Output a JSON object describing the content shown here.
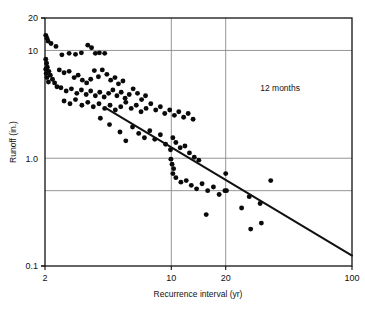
{
  "chart_data": {
    "type": "scatter",
    "title": "",
    "xlabel": "Recurrence interval (yr)",
    "ylabel": "Runoff (in.)",
    "xscale": "log",
    "yscale": "log",
    "xlim": [
      2,
      100
    ],
    "ylim": [
      0.1,
      20
    ],
    "xticks": [
      2,
      10,
      20,
      100
    ],
    "xtick_labels": [
      "2",
      "10",
      "20",
      "100"
    ],
    "yticks": [
      0.1,
      1.0,
      10,
      20
    ],
    "ytick_labels": [
      "0.1",
      "1.0",
      "10",
      "20"
    ],
    "gridlines_x": [
      10,
      20
    ],
    "gridlines_y": [
      0.5,
      1.0,
      10
    ],
    "grid": true,
    "legend": "none",
    "annotations": [
      {
        "text": "12 months",
        "x": 40,
        "y": 4.2
      }
    ],
    "series": [
      {
        "name": "trend-line",
        "type": "line",
        "points": [
          [
            4.3,
            2.95
          ],
          [
            100,
            0.125
          ]
        ]
      },
      {
        "name": "observations",
        "type": "scatter",
        "points": [
          [
            2.02,
            13.8
          ],
          [
            2.05,
            13.0
          ],
          [
            2.08,
            12.2
          ],
          [
            2.16,
            11.6
          ],
          [
            2.3,
            10.9
          ],
          [
            2.48,
            9.1
          ],
          [
            2.72,
            9.4
          ],
          [
            2.95,
            9.2
          ],
          [
            3.18,
            9.5
          ],
          [
            3.45,
            11.2
          ],
          [
            3.62,
            10.6
          ],
          [
            3.8,
            9.4
          ],
          [
            4.0,
            9.5
          ],
          [
            4.28,
            9.4
          ],
          [
            2.02,
            8.3
          ],
          [
            2.04,
            7.6
          ],
          [
            2.06,
            7.0
          ],
          [
            2.1,
            6.4
          ],
          [
            2.14,
            5.9
          ],
          [
            2.2,
            5.4
          ],
          [
            2.26,
            5.0
          ],
          [
            2.33,
            4.6
          ],
          [
            2.02,
            6.7
          ],
          [
            2.03,
            6.1
          ],
          [
            2.05,
            5.6
          ],
          [
            2.09,
            5.1
          ],
          [
            2.4,
            6.6
          ],
          [
            2.55,
            6.2
          ],
          [
            2.72,
            6.4
          ],
          [
            2.9,
            5.6
          ],
          [
            3.05,
            5.9
          ],
          [
            3.22,
            5.3
          ],
          [
            3.4,
            5.0
          ],
          [
            3.58,
            5.4
          ],
          [
            3.75,
            6.5
          ],
          [
            3.95,
            5.7
          ],
          [
            4.15,
            6.6
          ],
          [
            4.4,
            6.0
          ],
          [
            4.62,
            5.3
          ],
          [
            4.88,
            5.6
          ],
          [
            5.1,
            4.9
          ],
          [
            5.4,
            5.2
          ],
          [
            2.45,
            4.5
          ],
          [
            2.62,
            4.2
          ],
          [
            2.8,
            4.4
          ],
          [
            3.0,
            4.0
          ],
          [
            3.18,
            4.3
          ],
          [
            3.38,
            3.9
          ],
          [
            3.58,
            4.2
          ],
          [
            3.8,
            3.8
          ],
          [
            4.02,
            4.1
          ],
          [
            4.25,
            3.7
          ],
          [
            4.5,
            4.0
          ],
          [
            4.75,
            4.3
          ],
          [
            5.0,
            3.8
          ],
          [
            5.28,
            4.1
          ],
          [
            5.55,
            3.6
          ],
          [
            5.85,
            3.9
          ],
          [
            6.15,
            4.4
          ],
          [
            6.5,
            4.0
          ],
          [
            6.85,
            3.5
          ],
          [
            7.2,
            3.8
          ],
          [
            2.55,
            3.4
          ],
          [
            2.75,
            3.2
          ],
          [
            2.95,
            3.5
          ],
          [
            3.2,
            3.1
          ],
          [
            3.45,
            3.3
          ],
          [
            3.7,
            3.0
          ],
          [
            3.98,
            3.2
          ],
          [
            4.28,
            2.9
          ],
          [
            4.58,
            3.1
          ],
          [
            4.9,
            2.8
          ],
          [
            5.25,
            3.0
          ],
          [
            5.6,
            3.3
          ],
          [
            6.0,
            2.9
          ],
          [
            6.4,
            3.1
          ],
          [
            6.8,
            2.7
          ],
          [
            7.25,
            2.9
          ],
          [
            7.7,
            3.2
          ],
          [
            8.2,
            2.8
          ],
          [
            8.7,
            3.0
          ],
          [
            9.2,
            2.6
          ],
          [
            9.8,
            2.8
          ],
          [
            10.4,
            2.5
          ],
          [
            11.0,
            2.7
          ],
          [
            11.7,
            2.4
          ],
          [
            12.4,
            2.6
          ],
          [
            13.2,
            2.3
          ],
          [
            4.05,
            2.35
          ],
          [
            4.55,
            2.05
          ],
          [
            5.2,
            1.75
          ],
          [
            5.6,
            1.45
          ],
          [
            6.1,
            1.95
          ],
          [
            6.6,
            1.7
          ],
          [
            7.1,
            1.55
          ],
          [
            7.6,
            1.8
          ],
          [
            8.1,
            1.5
          ],
          [
            8.7,
            1.65
          ],
          [
            9.3,
            1.35
          ],
          [
            9.9,
            1.2
          ],
          [
            10.2,
            1.55
          ],
          [
            10.6,
            1.4
          ],
          [
            11.2,
            1.25
          ],
          [
            11.9,
            1.3
          ],
          [
            12.6,
            1.12
          ],
          [
            13.4,
            1.02
          ],
          [
            14.2,
            0.96
          ],
          [
            9.95,
            0.98
          ],
          [
            10.1,
            0.88
          ],
          [
            10.3,
            0.8
          ],
          [
            10.2,
            0.72
          ],
          [
            10.6,
            0.66
          ],
          [
            11.3,
            0.6
          ],
          [
            12.1,
            0.62
          ],
          [
            12.9,
            0.56
          ],
          [
            13.8,
            0.52
          ],
          [
            14.8,
            0.58
          ],
          [
            15.9,
            0.5
          ],
          [
            17.1,
            0.54
          ],
          [
            18.4,
            0.46
          ],
          [
            19.8,
            0.5
          ],
          [
            15.6,
            0.3
          ],
          [
            20.0,
            0.72
          ],
          [
            20.2,
            0.5
          ],
          [
            27.0,
            0.44
          ],
          [
            31.0,
            0.38
          ],
          [
            35.5,
            0.62
          ],
          [
            31.5,
            0.25
          ],
          [
            27.5,
            0.22
          ],
          [
            24.5,
            0.345
          ]
        ]
      }
    ]
  },
  "axes": {
    "x_title": "Recurrence interval (yr)",
    "y_title": "Runoff (in.)"
  }
}
